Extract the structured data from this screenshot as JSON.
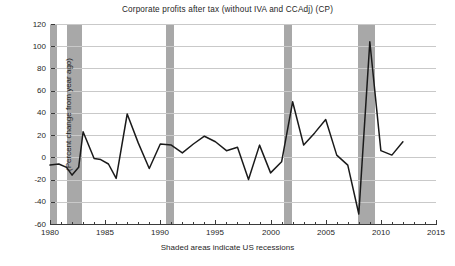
{
  "figure": {
    "title": "Corporate profits after tax (without IVA and CCAdj) (CP)",
    "xlabel": "Shaded areas indicate US recessions",
    "ylabel": "(Percent change from year ago)",
    "footer_note": "",
    "colors": {
      "line": "#1a1a1a",
      "recession_band": "#a8a8a8",
      "gridline": "#c9c9c9",
      "axis": "#3a3a3a",
      "background": "#ffffff"
    }
  },
  "chart_data": {
    "type": "line",
    "title": "Corporate profits after tax (without IVA and CCAdj) (CP)",
    "subtitle": "",
    "xlabel": "Shaded areas indicate US recessions",
    "ylabel": "(Percent change from year ago)",
    "xlim": [
      1980,
      2015
    ],
    "ylim": [
      -60,
      120
    ],
    "xticks": [
      1980,
      1985,
      1990,
      1995,
      2000,
      2005,
      2010,
      2015
    ],
    "yticks": [
      -60,
      -40,
      -20,
      0,
      20,
      40,
      60,
      80,
      100,
      120
    ],
    "grid": "horizontal",
    "legend": "none",
    "series": [
      {
        "name": "Corporate profits after tax (without IVA and CCAdj) (CP)",
        "color": "#1a1a1a",
        "x": [
          1980,
          1980.8,
          1981.5,
          1982,
          1982.6,
          1983,
          1984,
          1984.6,
          1985.3,
          1986,
          1987,
          1988,
          1989,
          1990,
          1991,
          1992,
          1993,
          1994,
          1995,
          1996,
          1997,
          1998,
          1999,
          2000,
          2001,
          2002,
          2003,
          2004,
          2005,
          2006,
          2007,
          2008,
          2009,
          2010,
          2011,
          2012
        ],
        "y": [
          -7,
          -6,
          -9,
          -16,
          -9,
          23,
          -1,
          -2,
          -6,
          -19,
          39,
          13,
          -10,
          12,
          11,
          4,
          12,
          19,
          14,
          6,
          9,
          -20,
          11,
          -14,
          -4,
          50,
          11,
          22,
          34,
          2,
          -7,
          -51,
          104,
          6,
          2,
          14
        ]
      }
    ],
    "recession_bands": [
      {
        "start": 1980.0,
        "end": 1980.6
      },
      {
        "start": 1981.5,
        "end": 1982.9
      },
      {
        "start": 1990.5,
        "end": 1991.2
      },
      {
        "start": 2001.2,
        "end": 2001.9
      },
      {
        "start": 2007.9,
        "end": 2009.5
      }
    ]
  }
}
